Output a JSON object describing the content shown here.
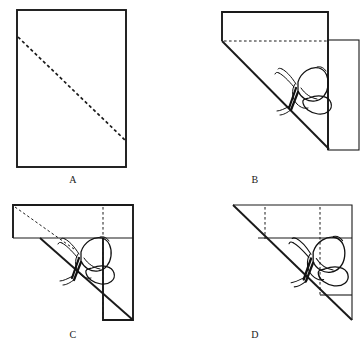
{
  "figure": {
    "type": "paper-folding-diagram",
    "background_color": "#ffffff",
    "line_color": "#1a1a1a",
    "panels": [
      {
        "id": "A",
        "label": "A",
        "label_x": 73,
        "label_y": 180,
        "shape": "rectangle",
        "rect": {
          "x": 17,
          "y": 10,
          "width": 109,
          "height": 157
        },
        "dashed_lines": [
          {
            "kind": "diagonal",
            "x1": 18,
            "y1": 37,
            "x2": 125,
            "y2": 140
          }
        ],
        "has_butterfly": false
      },
      {
        "id": "B",
        "label": "B",
        "label_x": 255,
        "label_y": 180,
        "shape": "folded-corner",
        "outline": "222,12 328,12 328,148 275,41 222,41",
        "right_flap": {
          "x": 328,
          "y": 40,
          "width": 31,
          "height": 110
        },
        "dashed_lines": [
          {
            "kind": "horizontal-fold",
            "x1": 224,
            "y1": 41,
            "x2": 327,
            "y2": 41
          }
        ],
        "diagonal": {
          "x1": 222,
          "y1": 41,
          "x2": 328,
          "y2": 148
        },
        "has_butterfly": true,
        "butterfly": {
          "cx": 295,
          "cy": 78,
          "scale": 1.0,
          "rotation": 0
        }
      },
      {
        "id": "C",
        "label": "C",
        "label_x": 73,
        "label_y": 335,
        "shape": "folded-corner-rotated",
        "top_band": {
          "x": 13,
          "y": 205,
          "width": 120,
          "height": 33
        },
        "lower_flap": {
          "x": 103,
          "y": 238,
          "width": 30,
          "height": 82
        },
        "dashed_lines": [
          {
            "kind": "diagonal",
            "x1": 15,
            "y1": 207,
            "x2": 72,
            "y2": 247
          },
          {
            "kind": "vertical-fold",
            "x1": 103,
            "y1": 207,
            "x2": 103,
            "y2": 318
          }
        ],
        "diagonal": {
          "x1": 40,
          "y1": 238,
          "x2": 133,
          "y2": 320
        },
        "has_butterfly": true,
        "butterfly": {
          "cx": 78,
          "cy": 248,
          "scale": 1.0,
          "rotation": 0
        }
      },
      {
        "id": "D",
        "label": "D",
        "label_x": 255,
        "label_y": 335,
        "shape": "triangle-with-folds",
        "outline": "233,205 352,205 352,320",
        "horizontal_lines": [
          {
            "x1": 258,
            "y1": 238,
            "x2": 352,
            "y2": 238
          },
          {
            "x1": 320,
            "y1": 295,
            "x2": 352,
            "y2": 295
          }
        ],
        "dashed_lines": [
          {
            "kind": "vertical-fold",
            "x1": 265,
            "y1": 207,
            "x2": 265,
            "y2": 238
          },
          {
            "kind": "vertical-fold",
            "x1": 320,
            "y1": 207,
            "x2": 320,
            "y2": 295
          }
        ],
        "diagonal": {
          "x1": 233,
          "y1": 205,
          "x2": 352,
          "y2": 320
        },
        "has_butterfly": true,
        "butterfly": {
          "cx": 310,
          "cy": 248,
          "scale": 1.05,
          "rotation": 0
        }
      }
    ]
  }
}
